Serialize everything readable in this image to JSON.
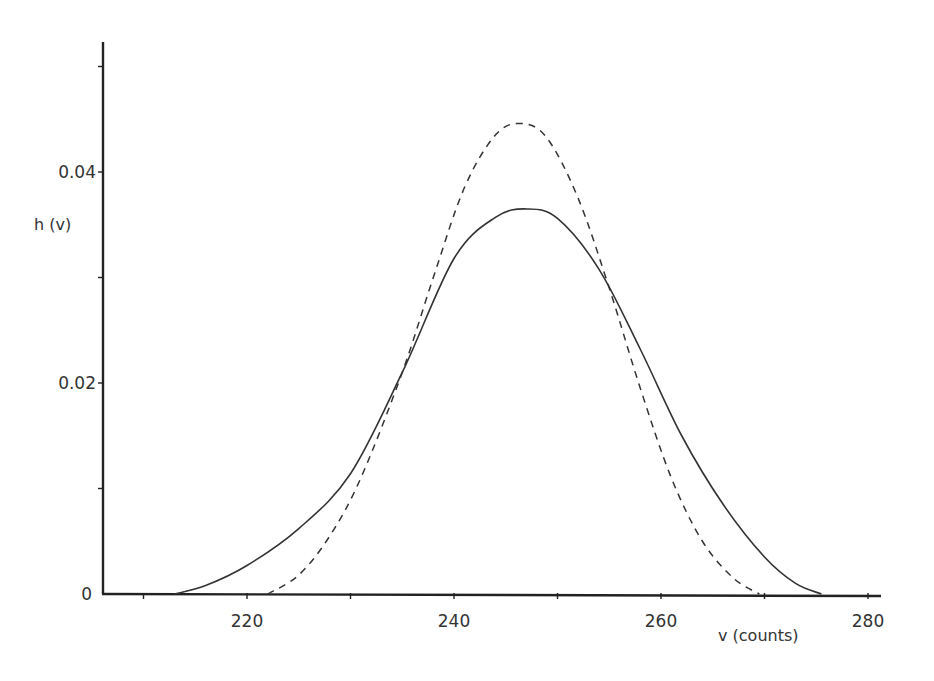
{
  "chart_data": {
    "type": "line",
    "title": "",
    "xlabel": "v (counts)",
    "ylabel": "h (v)",
    "xlim": [
      206,
      281
    ],
    "ylim": [
      0,
      0.052
    ],
    "grid": false,
    "legend": null,
    "x_ticks": [
      210,
      220,
      230,
      240,
      250,
      260,
      270,
      280
    ],
    "x_tick_labels": [
      "",
      "220",
      "",
      "240",
      "",
      "260",
      "",
      "280"
    ],
    "y_ticks": [
      0,
      0.01,
      0.02,
      0.03,
      0.04,
      0.05
    ],
    "y_tick_labels": [
      "0",
      "",
      "0.02",
      "",
      "0.04",
      ""
    ],
    "series": [
      {
        "name": "solid curve",
        "style": "solid",
        "x": [
          213,
          216,
          220,
          225,
          230,
          235,
          240,
          244,
          247,
          250,
          254,
          258,
          262,
          266,
          270,
          273,
          275.5
        ],
        "y": [
          0,
          0.0008,
          0.0027,
          0.0062,
          0.0114,
          0.021,
          0.0318,
          0.0357,
          0.0365,
          0.0356,
          0.0308,
          0.0232,
          0.015,
          0.0085,
          0.0035,
          0.001,
          0
        ]
      },
      {
        "name": "dashed curve",
        "style": "dashed",
        "x": [
          222,
          225,
          228,
          231,
          235,
          238,
          241,
          244,
          246.5,
          249,
          252,
          255,
          258,
          261,
          264,
          267,
          269.5
        ],
        "y": [
          0,
          0.0018,
          0.0055,
          0.011,
          0.021,
          0.03,
          0.0385,
          0.0435,
          0.0446,
          0.0432,
          0.0375,
          0.029,
          0.0195,
          0.011,
          0.005,
          0.0015,
          0
        ]
      }
    ]
  }
}
